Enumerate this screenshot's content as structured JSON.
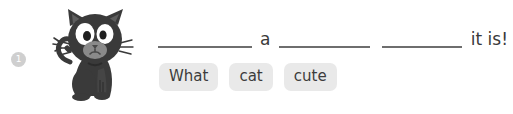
{
  "question": {
    "number": "1",
    "badge_color": "#cfcfcf"
  },
  "illustration": {
    "icon": "cat-illustration",
    "alt": "black cat",
    "body_color": "#3a3a3a",
    "muzzle_color": "#8a8a8a",
    "eye_color": "#ffffff",
    "pupil_color": "#1f1f1f"
  },
  "sentence": {
    "blank_1": "",
    "word_a": "a",
    "blank_2": "",
    "blank_3": "",
    "tail_text": "it is!",
    "line_color": "#6e6e6e"
  },
  "word_bank": {
    "chip_bg": "#e9e9e9",
    "chips": [
      {
        "label": "What"
      },
      {
        "label": "cat"
      },
      {
        "label": "cute"
      }
    ]
  }
}
